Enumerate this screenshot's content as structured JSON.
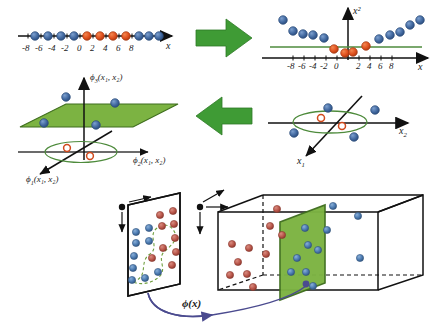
{
  "figure": {
    "colors": {
      "class_blue": "#41689f",
      "class_blue_dark": "#2a4a78",
      "class_red": "#e0511f",
      "class_red_dark": "#a53a12",
      "plane_green": "#7cb342",
      "plane_green_dark": "#3f6e1e",
      "arrow_green": "#3f9b35",
      "line_green": "#4e8b3c",
      "axis_black": "#111111",
      "map_arrow_purple": "#4b4b8f",
      "background": "#ffffff"
    }
  },
  "panel_top_left": {
    "name": "1D input space number line",
    "axis_label": "x",
    "ticks": [
      "-8",
      "-6",
      "-4",
      "-2",
      "0",
      "2",
      "4",
      "6",
      "8"
    ],
    "tick_values": [
      -8,
      -6,
      -4,
      -2,
      0,
      2,
      4,
      6,
      8
    ],
    "points": [
      {
        "x": -9,
        "class": "blue"
      },
      {
        "x": -7,
        "class": "blue"
      },
      {
        "x": -5,
        "class": "blue"
      },
      {
        "x": -3,
        "class": "blue"
      },
      {
        "x": -1,
        "class": "red"
      },
      {
        "x": 1,
        "class": "red"
      },
      {
        "x": 3,
        "class": "red"
      },
      {
        "x": 5,
        "class": "red"
      },
      {
        "x": 7,
        "class": "blue"
      },
      {
        "x": 9,
        "class": "blue"
      },
      {
        "x": 11,
        "class": "blue"
      },
      {
        "x": 13,
        "class": "blue"
      }
    ]
  },
  "panel_top_right": {
    "name": "1D mapped to squared feature space",
    "x_axis_label": "x",
    "y_axis_label": "x²",
    "ticks": [
      "-8",
      "-6",
      "-4",
      "-2",
      "0",
      "2",
      "4",
      "6",
      "8"
    ],
    "tick_values": [
      -8,
      -6,
      -4,
      -2,
      0,
      2,
      4,
      6,
      8
    ],
    "separator_line": "horizontal green threshold",
    "points": [
      {
        "x": -9,
        "y": 81,
        "class": "blue"
      },
      {
        "x": -7,
        "y": 49,
        "class": "blue"
      },
      {
        "x": -6,
        "y": 36,
        "class": "blue"
      },
      {
        "x": -5,
        "y": 25,
        "class": "blue"
      },
      {
        "x": -4,
        "y": 16,
        "class": "blue"
      },
      {
        "x": -2,
        "y": 4,
        "class": "red"
      },
      {
        "x": -0.5,
        "y": 0.25,
        "class": "red"
      },
      {
        "x": 1,
        "y": 1,
        "class": "red"
      },
      {
        "x": 2.5,
        "y": 6,
        "class": "red"
      },
      {
        "x": 4,
        "y": 16,
        "class": "blue"
      },
      {
        "x": 5,
        "y": 25,
        "class": "blue"
      },
      {
        "x": 6.5,
        "y": 42,
        "class": "blue"
      },
      {
        "x": 8,
        "y": 64,
        "class": "blue"
      },
      {
        "x": 9,
        "y": 81,
        "class": "blue"
      }
    ]
  },
  "panel_mid_left": {
    "name": "3D feature space with separating plane",
    "axis_labels": {
      "vertical": "ϕ₃(x₁, x₂)",
      "vertical_parts": {
        "phi": "ϕ",
        "sub": "3",
        "args": "(x₁, x₂)"
      },
      "right": "ϕ₂(x₁, x₂)",
      "right_parts": {
        "phi": "ϕ",
        "sub": "2",
        "args": "(x₁, x₂)"
      },
      "front": "ϕ₁(x₁, x₂)",
      "front_parts": {
        "phi": "ϕ",
        "sub": "1",
        "args": "(x₁, x₂)"
      }
    },
    "separating_surface": "green plane",
    "blue_points": 4,
    "red_points": 2,
    "ellipse": "green ellipse on base plane"
  },
  "panel_mid_right": {
    "name": "2D input space with non-linear elliptical boundary",
    "x_axis_label": "x₂",
    "x_axis_parts": {
      "var": "x",
      "sub": "2"
    },
    "y_axis_label": "x₁",
    "y_axis_parts": {
      "var": "x",
      "sub": "1"
    },
    "boundary": "green ellipse",
    "blue_points": 4,
    "red_points": 2
  },
  "panel_bottom": {
    "name": "Feature map from 2D plane to 3D box",
    "map_label": "ϕ(x)",
    "left": {
      "name": "input space plane",
      "boundary": "green dashed non-linear curve",
      "blue_points": 9,
      "red_points": 9
    },
    "right": {
      "name": "feature space box",
      "boundary": "green separating plane",
      "blue_points": 10,
      "red_points": 10
    }
  }
}
